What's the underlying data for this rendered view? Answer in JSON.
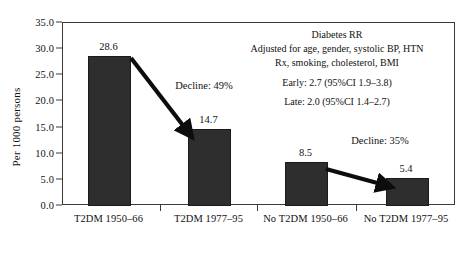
{
  "chart_data": {
    "type": "bar",
    "title": "",
    "xlabel": "",
    "ylabel": "Per 1000 persons",
    "ylim": [
      0.0,
      35.0
    ],
    "grid": false,
    "legend": "none",
    "categories": [
      "T2DM 1950–66",
      "T2DM 1977–95",
      "No T2DM 1950–66",
      "No T2DM 1977–95"
    ],
    "values": [
      28.6,
      14.7,
      8.5,
      5.4
    ],
    "value_labels": [
      "28.6",
      "14.7",
      "8.5",
      "5.4"
    ],
    "ytick_labels": [
      "0.0",
      "5.0",
      "10.0",
      "15.0",
      "20.0",
      "25.0",
      "30.0",
      "35.0"
    ],
    "ytick_values": [
      0.0,
      5.0,
      10.0,
      15.0,
      20.0,
      25.0,
      30.0,
      35.0
    ],
    "annotations": [
      {
        "text": "Decline: 49%",
        "from_category": "T2DM 1950–66",
        "to_category": "T2DM 1977–95",
        "decline_pct": 49
      },
      {
        "text": "Decline: 35%",
        "from_category": "No T2DM 1950–66",
        "to_category": "No T2DM 1977–95",
        "decline_pct": 35
      }
    ],
    "info_box": {
      "line1": "Diabetes RR",
      "line2": "Adjusted for age, gender, systolic BP, HTN",
      "line3": "Rx, smoking, cholesterol, BMI",
      "line4": "Early: 2.7 (95%CI 1.9–3.8)",
      "line5": "Late: 2.0 (95%CI 1.4–2.7)"
    },
    "bar_color": "#2e2e2e",
    "axis_color": "#3a3a3a",
    "text_color": "#111111",
    "background_color": "#ffffff"
  }
}
